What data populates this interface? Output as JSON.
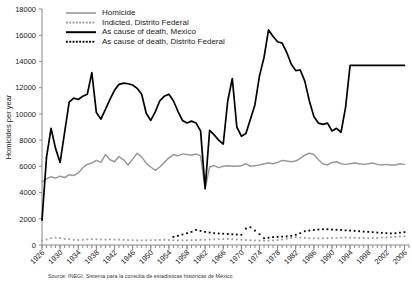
{
  "chart_data": {
    "type": "line",
    "title": "",
    "xlabel": "",
    "ylabel": "Homicides per year",
    "xlim": [
      1926,
      2007
    ],
    "ylim": [
      0,
      18000
    ],
    "yticks": [
      0,
      2000,
      4000,
      6000,
      8000,
      10000,
      12000,
      14000,
      16000,
      18000
    ],
    "xticks": [
      1926,
      1930,
      1934,
      1938,
      1942,
      1946,
      1950,
      1954,
      1958,
      1962,
      1966,
      1970,
      1974,
      1978,
      1982,
      1986,
      1990,
      1994,
      1998,
      2002,
      2006
    ],
    "xtick_minor_step": 1,
    "grid": false,
    "legend_position": "top-left",
    "series": [
      {
        "name": "Homicide",
        "color": "#999999",
        "style": "solid",
        "x": [
          1926,
          1927,
          1928,
          1929,
          1930,
          1931,
          1932,
          1933,
          1934,
          1935,
          1936,
          1937,
          1938,
          1939,
          1940,
          1941,
          1942,
          1943,
          1944,
          1945,
          1946,
          1947,
          1948,
          1949,
          1950,
          1951,
          1952,
          1953,
          1954,
          1955,
          1956,
          1957,
          1958,
          1959,
          1960,
          1961,
          1962,
          1963,
          1964,
          1965,
          1966,
          1967,
          1968,
          1969,
          1970,
          1971,
          1972,
          1973,
          1974,
          1975,
          1976,
          1977,
          1978,
          1979,
          1980,
          1981,
          1982,
          1983,
          1984,
          1985,
          1986,
          1987,
          1988,
          1989,
          1990,
          1991,
          1992,
          1993,
          1994,
          1995,
          1996,
          1997,
          1998,
          1999,
          2000,
          2001,
          2002,
          2003,
          2004,
          2005,
          2006
        ],
        "y": [
          4800,
          5050,
          5200,
          5100,
          5250,
          5150,
          5350,
          5300,
          5500,
          5900,
          6150,
          6250,
          6450,
          6300,
          6900,
          6500,
          6350,
          6750,
          6500,
          6100,
          6550,
          7000,
          6700,
          6250,
          5950,
          5700,
          5950,
          6300,
          6650,
          6900,
          6800,
          6950,
          6900,
          6850,
          6950,
          6800,
          4300,
          5950,
          6050,
          5900,
          6000,
          6050,
          6000,
          6000,
          6050,
          6200,
          6000,
          6050,
          6100,
          6200,
          6250,
          6200,
          6300,
          6450,
          6400,
          6350,
          6400,
          6600,
          6850,
          7000,
          6900,
          6500,
          6200,
          6100,
          6300,
          6350,
          6200,
          6150,
          6200,
          6250,
          6200,
          6150,
          6200,
          6250,
          6150,
          6100,
          6150,
          6100,
          6100,
          6200,
          6150
        ]
      },
      {
        "name": "Indicted, Distrito Federal",
        "color": "#9a9a9a",
        "style": "dotted",
        "x": [
          1926,
          1927,
          1928,
          1929,
          1930,
          1931,
          1932,
          1933,
          1934,
          1935,
          1936,
          1937,
          1938,
          1939,
          1940,
          1941,
          1942,
          1943,
          1944,
          1945,
          1946,
          1947,
          1948,
          1949,
          1950,
          1951,
          1952,
          1953,
          1954,
          1955,
          1956,
          1957,
          1958,
          1959,
          1960,
          1961,
          1962,
          1963,
          1964,
          1965,
          1966,
          1967,
          1968,
          1969,
          1970,
          1971,
          1972,
          1973,
          1974,
          1975,
          1976,
          1977,
          1978,
          1979,
          1980,
          1981,
          1982,
          1983,
          1984,
          1985,
          1986,
          1987,
          1988,
          1989,
          1990,
          1991,
          1992,
          1993,
          1994,
          1995,
          1996,
          1997,
          1998,
          1999,
          2000,
          2001,
          2002,
          2003,
          2004,
          2005,
          2006
        ],
        "y": [
          330,
          420,
          520,
          560,
          520,
          470,
          440,
          400,
          380,
          400,
          430,
          450,
          440,
          420,
          410,
          430,
          420,
          400,
          390,
          380,
          370,
          360,
          350,
          360,
          370,
          380,
          390,
          400,
          380,
          370,
          360,
          350,
          360,
          370,
          380,
          390,
          400,
          420,
          430,
          440,
          450,
          460,
          440,
          420,
          400,
          380,
          360,
          350,
          340,
          330,
          340,
          350,
          380,
          420,
          480,
          540,
          600,
          560,
          540,
          520,
          510,
          500,
          510,
          520,
          530,
          540,
          560,
          570,
          560,
          550,
          540,
          530,
          520,
          530,
          540,
          560,
          580,
          600,
          620,
          640,
          660
        ]
      },
      {
        "name": "As cause of death, Mexico",
        "color": "#000000",
        "style": "solid",
        "x": [
          1926,
          1927,
          1928,
          1929,
          1930,
          1931,
          1932,
          1933,
          1934,
          1935,
          1936,
          1937,
          1938,
          1939,
          1940,
          1941,
          1942,
          1943,
          1944,
          1945,
          1946,
          1947,
          1948,
          1949,
          1950,
          1951,
          1952,
          1953,
          1954,
          1955,
          1956,
          1957,
          1958,
          1959,
          1960,
          1961,
          1962,
          1963,
          1964,
          1965,
          1966,
          1967,
          1968,
          1969,
          1970,
          1971,
          1972,
          1973,
          1974,
          1975,
          1976,
          1977,
          1978,
          1979,
          1980,
          1981,
          1982,
          1983,
          1984,
          1985,
          1986,
          1987,
          1988,
          1989,
          1990,
          1991,
          1992,
          1993,
          1994,
          1995,
          1996,
          1997,
          1998,
          1999,
          2000,
          2001,
          2002,
          2003,
          2004,
          2005,
          2006
        ],
        "y": [
          1900,
          6700,
          8900,
          7350,
          6300,
          8600,
          10900,
          11200,
          11100,
          11350,
          11500,
          13150,
          10100,
          9600,
          10350,
          11100,
          11800,
          12250,
          12350,
          12300,
          12200,
          11950,
          11500,
          10050,
          9500,
          10150,
          11000,
          11350,
          11500,
          11000,
          10200,
          9500,
          9300,
          9450,
          9300,
          8700,
          4300,
          8750,
          8400,
          8000,
          7700,
          11000,
          12700,
          9000,
          8300,
          8500,
          9600,
          10700,
          12900,
          14300,
          16400,
          15900,
          15500,
          15400,
          14700,
          13800,
          13300,
          13350,
          12500,
          11000,
          9800,
          9300,
          9200,
          9300,
          8700,
          8900,
          8600,
          10500,
          13700,
          13700,
          13700,
          13700,
          13700,
          13700,
          13700,
          13700,
          13700,
          13700,
          13700,
          13700,
          13700
        ]
      },
      {
        "name": "As cause of death, Distrito Federal",
        "color": "#000000",
        "style": "dotted",
        "x": [
          1955,
          1956,
          1957,
          1958,
          1959,
          1960,
          1961,
          1962,
          1963,
          1964,
          1965,
          1966,
          1967,
          1968,
          1969,
          1970,
          1971,
          1972,
          1973,
          1974,
          1975,
          1976,
          1977,
          1978,
          1979,
          1980,
          1981,
          1982,
          1983,
          1984,
          1985,
          1986,
          1987,
          1988,
          1989,
          1990,
          1991,
          1992,
          1993,
          1994,
          1995,
          1996,
          1997,
          1998,
          1999,
          2000,
          2001,
          2002,
          2003,
          2004,
          2005,
          2006
        ],
        "y": [
          620,
          700,
          800,
          900,
          1000,
          1150,
          1080,
          1000,
          950,
          900,
          880,
          860,
          840,
          820,
          800,
          780,
          1250,
          1350,
          1100,
          820,
          520,
          560,
          600,
          620,
          640,
          660,
          700,
          780,
          900,
          1050,
          1100,
          1150,
          1180,
          1200,
          1200,
          1180,
          1160,
          1150,
          1120,
          1100,
          1080,
          1050,
          1020,
          1000,
          980,
          950,
          930,
          900,
          880,
          900,
          940,
          980
        ]
      }
    ]
  },
  "legend": {
    "items": [
      {
        "label": "Homicide"
      },
      {
        "label": "Indicted, Distrito Federal"
      },
      {
        "label": "As cause of death, Mexico"
      },
      {
        "label": "As cause of death, Distrito Federal"
      }
    ]
  },
  "source_note": "Source: INEGI, Sistema para la consulta de estadísticas históricas de México"
}
